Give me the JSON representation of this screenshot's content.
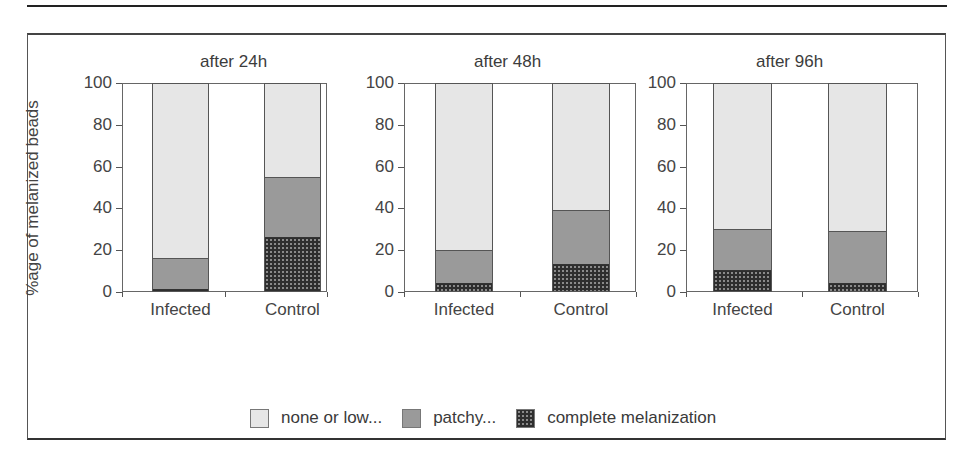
{
  "figure": {
    "ylabel": "%age of melanized beads",
    "legend": [
      {
        "key": "none",
        "label": "none or low...",
        "color": "#e6e6e6"
      },
      {
        "key": "patchy",
        "label": "patchy...",
        "color": "#9a9a9a"
      },
      {
        "key": "complete",
        "label": "complete melanization",
        "color": "#2e2e2e"
      }
    ],
    "yticks": [
      "100",
      "80",
      "60",
      "40",
      "20",
      "0"
    ],
    "panels": [
      {
        "title": "after 24h",
        "categories": [
          "Infected",
          "Control"
        ]
      },
      {
        "title": "after 48h",
        "categories": [
          "Infected",
          "Control"
        ]
      },
      {
        "title": "after 96h",
        "categories": [
          "Infected",
          "Control"
        ]
      }
    ]
  },
  "chart_data": [
    {
      "type": "bar",
      "stacked": true,
      "title": "after 24h",
      "xlabel": "",
      "ylabel": "%age of melanized beads",
      "ylim": [
        0,
        100
      ],
      "yticks": [
        0,
        20,
        40,
        60,
        80,
        100
      ],
      "categories": [
        "Infected",
        "Control"
      ],
      "series": [
        {
          "name": "complete melanization",
          "values": [
            1,
            26
          ]
        },
        {
          "name": "patchy...",
          "values": [
            15,
            29
          ]
        },
        {
          "name": "none or low...",
          "values": [
            84,
            45
          ]
        }
      ],
      "grid": false,
      "legend_position": "bottom"
    },
    {
      "type": "bar",
      "stacked": true,
      "title": "after 48h",
      "xlabel": "",
      "ylabel": "%age of melanized beads",
      "ylim": [
        0,
        100
      ],
      "yticks": [
        0,
        20,
        40,
        60,
        80,
        100
      ],
      "categories": [
        "Infected",
        "Control"
      ],
      "series": [
        {
          "name": "complete melanization",
          "values": [
            4,
            13
          ]
        },
        {
          "name": "patchy...",
          "values": [
            16,
            26
          ]
        },
        {
          "name": "none or low...",
          "values": [
            80,
            61
          ]
        }
      ],
      "grid": false,
      "legend_position": "bottom"
    },
    {
      "type": "bar",
      "stacked": true,
      "title": "after 96h",
      "xlabel": "",
      "ylabel": "%age of melanized beads",
      "ylim": [
        0,
        100
      ],
      "yticks": [
        0,
        20,
        40,
        60,
        80,
        100
      ],
      "categories": [
        "Infected",
        "Control"
      ],
      "series": [
        {
          "name": "complete melanization",
          "values": [
            10,
            4
          ]
        },
        {
          "name": "patchy...",
          "values": [
            20,
            25
          ]
        },
        {
          "name": "none or low...",
          "values": [
            70,
            71
          ]
        }
      ],
      "grid": false,
      "legend_position": "bottom"
    }
  ]
}
